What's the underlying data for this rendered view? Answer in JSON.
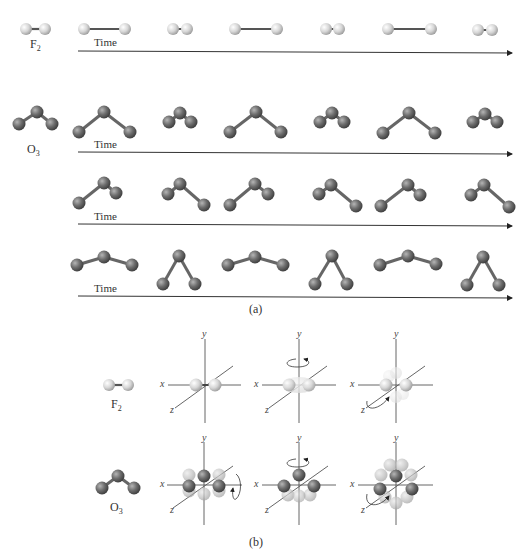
{
  "figure": {
    "panel_a": {
      "caption": "(a)",
      "time_label": "Time",
      "f2": {
        "label": "F",
        "subscript": "2",
        "description": "Stretching vibration of F2 over time",
        "frames": [
          "stretched",
          "compressed",
          "stretched",
          "compressed",
          "stretched",
          "compressed"
        ]
      },
      "o3": {
        "label": "O",
        "subscript": "3",
        "modes": [
          {
            "name": "symmetric stretch",
            "frames": [
              "stretched",
              "compressed",
              "stretched",
              "compressed",
              "stretched",
              "compressed"
            ]
          },
          {
            "name": "asymmetric stretch",
            "frames": [
              "left-long",
              "right-long",
              "left-long",
              "right-long",
              "left-long",
              "right-long"
            ]
          },
          {
            "name": "bending",
            "frames": [
              "open",
              "closed",
              "open",
              "closed",
              "open",
              "closed"
            ]
          }
        ]
      }
    },
    "panel_b": {
      "caption": "(b)",
      "f2": {
        "label": "F",
        "subscript": "2",
        "rotations": [
          "about x-axis (none)",
          "about y-axis",
          "about z-axis"
        ]
      },
      "o3": {
        "label": "O",
        "subscript": "3",
        "rotations": [
          "about x-axis",
          "about y-axis",
          "about z-axis"
        ]
      },
      "axes": {
        "x": "x",
        "y": "y",
        "z": "z"
      }
    },
    "colors": {
      "fluorine": "#d4d4d4",
      "oxygen": "#6e6e6e",
      "bond_f": "#555555",
      "bond_o": "#6a6a6a",
      "axis": "#555555",
      "arrow": "#333333"
    }
  }
}
